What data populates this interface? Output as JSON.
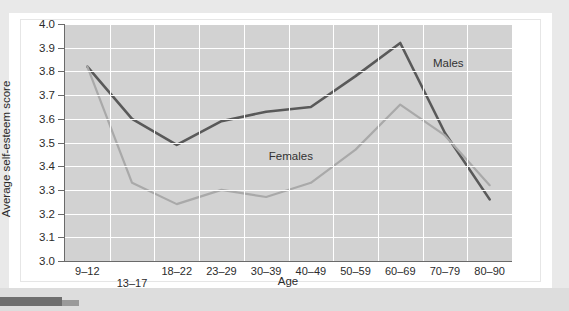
{
  "figure": {
    "y_axis_title": "Average self-esteem score",
    "x_axis_title": "Age",
    "series_labels": {
      "males": "Males",
      "females": "Females"
    },
    "colors": {
      "males_line": "#595959",
      "females_line": "#a9a9a9",
      "plot_background": "#d2d2d2",
      "gridline": "#ffffff",
      "axis": "#6a6a6a",
      "text": "#2b2b2b",
      "card_background": "#ffffff",
      "page_band": "#e9e9e9",
      "corner_mark": "#6e6e6e"
    }
  },
  "chart_data": {
    "type": "line",
    "title": "",
    "xlabel": "Age",
    "ylabel": "Average self-esteem score",
    "categories": [
      "9–12",
      "13–17",
      "18–22",
      "23–29",
      "30–39",
      "40–49",
      "50–59",
      "60–69",
      "70–79",
      "80–90"
    ],
    "ylim": [
      3.0,
      4.0
    ],
    "ytick_labels": [
      "3.0",
      "3.1",
      "3.2",
      "3.3",
      "3.4",
      "3.5",
      "3.6",
      "3.7",
      "3.8",
      "3.9",
      "4.0"
    ],
    "yticks": [
      3.0,
      3.1,
      3.2,
      3.3,
      3.4,
      3.5,
      3.6,
      3.7,
      3.8,
      3.9,
      4.0
    ],
    "grid": true,
    "legend": "inline-annotations",
    "series": [
      {
        "name": "Males",
        "color": "#595959",
        "values": [
          3.82,
          3.6,
          3.49,
          3.59,
          3.63,
          3.65,
          3.78,
          3.92,
          3.54,
          3.26
        ]
      },
      {
        "name": "Females",
        "color": "#a9a9a9",
        "values": [
          3.82,
          3.33,
          3.24,
          3.3,
          3.27,
          3.33,
          3.47,
          3.66,
          3.53,
          3.32
        ]
      }
    ],
    "annotations": [
      {
        "text": "Males",
        "x_category": "70–79",
        "y_value": 3.83
      },
      {
        "text": "Females",
        "x_category": "40–49",
        "y_value": 3.44
      }
    ]
  }
}
